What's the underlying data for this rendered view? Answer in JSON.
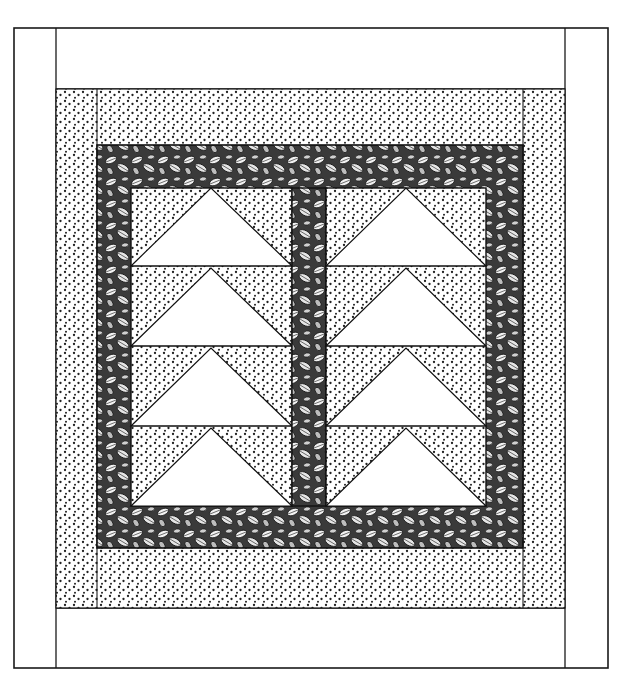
{
  "figure": {
    "colors": {
      "background": "#ffffff",
      "line": "#1a1a1a",
      "dot": "#222222",
      "leaf_fill": "#2a2a2a",
      "goose": "#ffffff"
    },
    "layers": [
      {
        "name": "outer-border",
        "fabric": "plain white"
      },
      {
        "name": "middle-border",
        "fabric": "dotted print"
      },
      {
        "name": "inner-border",
        "fabric": "leaf print"
      },
      {
        "name": "center-sashing",
        "fabric": "leaf print"
      },
      {
        "name": "geese-columns",
        "count": 2,
        "geese_per_column": 4,
        "goose_fabric": "plain white",
        "sky_fabric": "dotted print"
      }
    ]
  }
}
